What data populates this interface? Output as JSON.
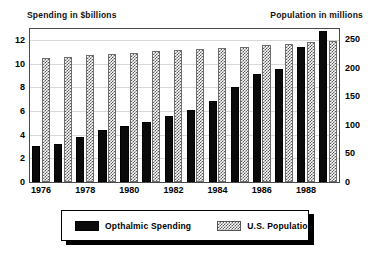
{
  "chart_data": {
    "type": "bar",
    "title": "",
    "xlabel": "",
    "ylabel": "Spending in $billions",
    "y2label": "Population in millions",
    "grid": true,
    "legend_position": "bottom",
    "categories": [
      "1976",
      "1977",
      "1978",
      "1979",
      "1980",
      "1981",
      "1982",
      "1983",
      "1984",
      "1985",
      "1986",
      "1987",
      "1988",
      "1989"
    ],
    "x_tick_labels": [
      "1976",
      "1978",
      "1980",
      "1982",
      "1984",
      "1986",
      "1988"
    ],
    "x_tick_categories": [
      "1976",
      "1978",
      "1980",
      "1982",
      "1984",
      "1986",
      "1988"
    ],
    "ylim": [
      0,
      13
    ],
    "y_ticks": [
      0,
      2,
      4,
      6,
      8,
      10,
      12
    ],
    "y2lim": [
      0,
      270
    ],
    "y2_ticks": [
      0,
      50,
      100,
      150,
      200,
      250
    ],
    "series": [
      {
        "name": "Opthalmic Spending",
        "axis": "left",
        "units": "$billions",
        "fill": "solid-black",
        "color": "#0a0a0a",
        "values": [
          3.0,
          3.25,
          3.8,
          4.4,
          4.75,
          5.1,
          5.6,
          6.1,
          6.8,
          8.0,
          9.1,
          9.5,
          11.4,
          12.75
        ]
      },
      {
        "name": "U.S. Population",
        "axis": "right",
        "units": "millions",
        "fill": "checkered",
        "color": "#5a5a5a",
        "values": [
          218,
          220,
          222,
          224,
          227,
          229,
          231,
          233,
          235,
          237,
          240,
          242,
          245,
          248
        ]
      }
    ]
  },
  "titles": {
    "left": "Spending in $billions",
    "right": "Population in millions"
  },
  "legend": {
    "items": [
      {
        "label": "Opthalmic Spending",
        "swatch": "solid-black"
      },
      {
        "label": "U.S. Population",
        "swatch": "checkered"
      }
    ]
  }
}
